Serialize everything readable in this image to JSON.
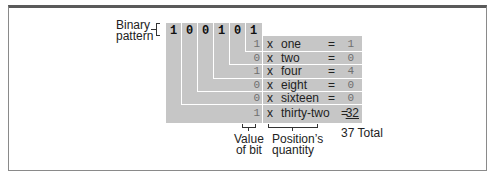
{
  "diagram": {
    "binary_label_line1": "Binary",
    "binary_label_line2": "pattern",
    "bits": [
      "1",
      "0",
      "0",
      "1",
      "0",
      "1"
    ],
    "rows": [
      {
        "bit": "1",
        "op": "x",
        "place": "one",
        "eq": "=",
        "result": "1"
      },
      {
        "bit": "0",
        "op": "x",
        "place": "two",
        "eq": "=",
        "result": "0"
      },
      {
        "bit": "1",
        "op": "x",
        "place": "four",
        "eq": "=",
        "result": "4"
      },
      {
        "bit": "0",
        "op": "x",
        "place": "eight",
        "eq": "=",
        "result": "0"
      },
      {
        "bit": "0",
        "op": "x",
        "place": "sixteen",
        "eq": "=",
        "result": "0"
      },
      {
        "bit": "1",
        "op": "x",
        "place": "thirty-two",
        "eq": "=",
        "result": "32"
      }
    ],
    "total": "37 Total",
    "value_label_line1": "Value",
    "value_label_line2": "of bit",
    "position_label_line1": "Position’s",
    "position_label_line2": "quantity",
    "colors": {
      "block_fill": "#c6c6c6",
      "frame_top": "#5a5a5a",
      "frame_border": "#8a8a8a"
    }
  }
}
